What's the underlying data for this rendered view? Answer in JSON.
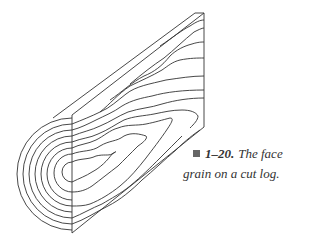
{
  "figure": {
    "stroke_color": "#333333"
  },
  "caption": {
    "marker_color": "#666666",
    "number": "1–20.",
    "line1_text": "The face",
    "line2_text": "grain on a cut log."
  }
}
